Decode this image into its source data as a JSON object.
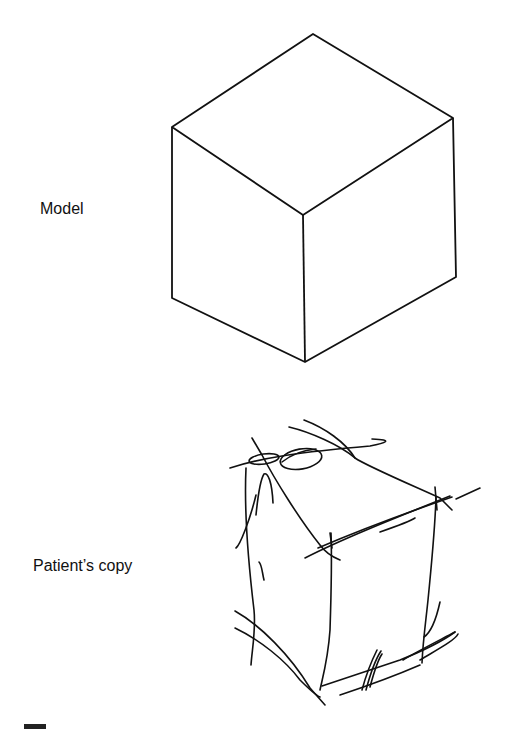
{
  "figure": {
    "panels": [
      {
        "label": "Model",
        "description": "isometric cube line drawing"
      },
      {
        "label": "Patient’s copy",
        "description": "sketchy, overdrawn attempt at copying the cube"
      }
    ],
    "line_color": "#111111",
    "background": "#ffffff"
  }
}
